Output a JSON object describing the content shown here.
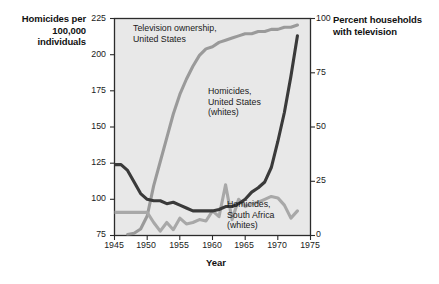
{
  "chart_data": {
    "type": "line",
    "title": "",
    "xlabel": "Year",
    "ylabel_left": "Homicides per 100,000 individuals",
    "ylabel_right": "Percent households with television",
    "xlim": [
      1945,
      1975
    ],
    "ylim_left": [
      75,
      225
    ],
    "ylim_right": [
      0,
      100
    ],
    "grid": false,
    "legend": "annotations-inline",
    "x_ticks": [
      "1945",
      "1950",
      "1955",
      "1960",
      "1965",
      "1970",
      "1975"
    ],
    "y_ticks_left": [
      "225",
      "200",
      "175",
      "150",
      "125",
      "100",
      "75"
    ],
    "y_ticks_right": [
      "100",
      "75",
      "50",
      "25",
      "0"
    ],
    "series": [
      {
        "name": "Television ownership, United States",
        "axis": "right",
        "color": "#9a9a9a",
        "x": [
          1947,
          1948,
          1949,
          1950,
          1951,
          1952,
          1953,
          1954,
          1955,
          1956,
          1957,
          1958,
          1959,
          1960,
          1961,
          1962,
          1963,
          1964,
          1965,
          1966,
          1967,
          1968,
          1969,
          1970,
          1971,
          1972,
          1973
        ],
        "values": [
          0.5,
          1,
          3,
          9,
          23,
          34,
          45,
          56,
          65,
          72,
          78,
          83,
          86,
          87,
          89,
          90,
          91,
          92,
          93,
          93,
          94,
          94,
          95,
          95,
          96,
          96,
          97
        ]
      },
      {
        "name": "Homicides, United States (whites)",
        "axis": "left",
        "color": "#3a3a3a",
        "x": [
          1945,
          1946,
          1947,
          1948,
          1949,
          1950,
          1951,
          1952,
          1953,
          1954,
          1955,
          1956,
          1957,
          1958,
          1959,
          1960,
          1961,
          1962,
          1963,
          1964,
          1965,
          1966,
          1967,
          1968,
          1969,
          1970,
          1971,
          1972,
          1973
        ],
        "values": [
          124,
          124,
          120,
          112,
          104,
          100,
          99,
          99,
          97,
          98,
          96,
          94,
          92,
          92,
          92,
          92,
          93,
          95,
          95,
          97,
          100,
          105,
          108,
          112,
          122,
          140,
          160,
          185,
          213
        ]
      },
      {
        "name": "Homicides, South Africa (whites)",
        "axis": "left",
        "color": "#a8a8a8",
        "x": [
          1945,
          1946,
          1947,
          1948,
          1949,
          1950,
          1951,
          1952,
          1953,
          1954,
          1955,
          1956,
          1957,
          1958,
          1959,
          1960,
          1961,
          1962,
          1963,
          1964,
          1965,
          1966,
          1967,
          1968,
          1969,
          1970,
          1971,
          1972,
          1973
        ],
        "values": [
          91,
          91,
          91,
          91,
          91,
          91,
          84,
          78,
          84,
          79,
          87,
          83,
          84,
          86,
          85,
          92,
          88,
          110,
          86,
          100,
          95,
          97,
          98,
          100,
          102,
          101,
          96,
          87,
          92
        ]
      }
    ],
    "annotations": [
      {
        "id": "tv-ownership",
        "lines": [
          "Television ownership,",
          "United States"
        ]
      },
      {
        "id": "us-homicides",
        "lines": [
          "Homicides,",
          "United States",
          "(whites)"
        ]
      },
      {
        "id": "sa-homicides",
        "lines": [
          "Homicides,",
          "South Africa",
          "(whites)"
        ]
      }
    ]
  },
  "axes": {
    "left_title_line1": "Homicides per",
    "left_title_line2": "100,000 individuals",
    "right_title_line1": "Percent households",
    "right_title_line2": "with television",
    "x_title": "Year"
  },
  "ticks": {
    "left": [
      "225",
      "200",
      "175",
      "150",
      "125",
      "100",
      "75"
    ],
    "right": [
      "100",
      "75",
      "50",
      "25",
      "0"
    ],
    "bottom": [
      "1945",
      "1950",
      "1955",
      "1960",
      "1965",
      "1970",
      "1975"
    ]
  },
  "annotations": {
    "tv_line1": "Television ownership,",
    "tv_line2": "United States",
    "us_line1": "Homicides,",
    "us_line2": "United States",
    "us_line3": "(whites)",
    "sa_line1": "Homicides,",
    "sa_line2": "South Africa",
    "sa_line3": "(whites)"
  },
  "colors": {
    "plot_background": "#e8e8e8",
    "plot_border": "#2b2b2b",
    "series_tv": "#9a9a9a",
    "series_us": "#3a3a3a",
    "series_sa": "#a8a8a8",
    "page_background": "#ffffff"
  }
}
